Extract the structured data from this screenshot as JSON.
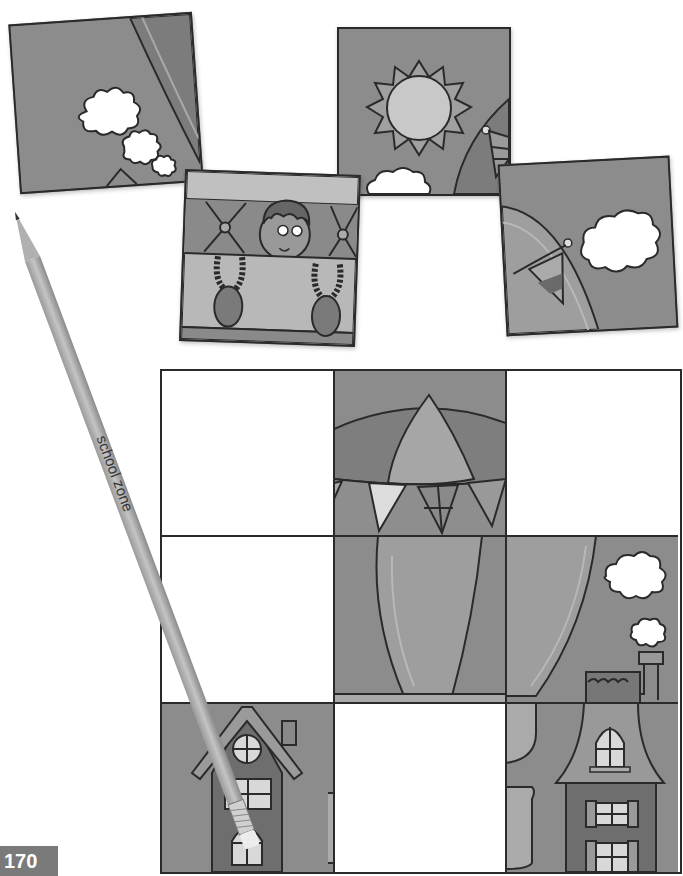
{
  "page": {
    "page_number": "170",
    "activity": "picture puzzle - match cut-out pieces to empty grid squares"
  },
  "loose_pieces": [
    {
      "id": "piece-top-left",
      "depicts": "sky with balloon edge and three clouds, house roof tip"
    },
    {
      "id": "piece-boy",
      "depicts": "boy in balloon basket"
    },
    {
      "id": "piece-sun",
      "depicts": "sun with clouds and balloon edge with pennant"
    },
    {
      "id": "piece-cloud-right",
      "depicts": "balloon edge with pennant and cloud"
    }
  ],
  "grid": {
    "rows": 3,
    "cols": 3,
    "cells": [
      {
        "row": 1,
        "col": 1,
        "state": "empty"
      },
      {
        "row": 1,
        "col": 2,
        "state": "filled",
        "depicts": "balloon top with pennants"
      },
      {
        "row": 1,
        "col": 3,
        "state": "empty"
      },
      {
        "row": 2,
        "col": 1,
        "state": "empty"
      },
      {
        "row": 2,
        "col": 2,
        "state": "filled",
        "depicts": "balloon body"
      },
      {
        "row": 2,
        "col": 3,
        "state": "filled",
        "depicts": "balloon side with clouds and chimney"
      },
      {
        "row": 3,
        "col": 1,
        "state": "filled",
        "depicts": "house with round window"
      },
      {
        "row": 3,
        "col": 2,
        "state": "empty"
      },
      {
        "row": 3,
        "col": 3,
        "state": "filled",
        "depicts": "tall house with arched window"
      }
    ]
  },
  "pencil": {
    "brand_text": "school zone",
    "registered_mark": "®"
  },
  "colors": {
    "outline": "#2a2a2a",
    "sky": "#8c8c8c",
    "balloon": "#9e9e9e",
    "balloon_dark": "#7c7c7c",
    "cloud": "#ffffff",
    "house": "#6e6e6e",
    "window": "#d8d8d8",
    "page_tab": "#7a7a7a"
  }
}
